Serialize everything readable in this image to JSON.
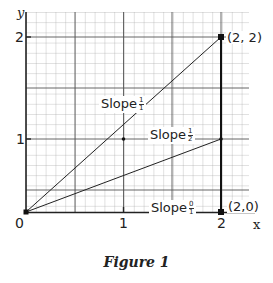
{
  "figure": {
    "caption": "Figure 1",
    "x_axis_label": "x",
    "y_axis_label": "y",
    "x_ticks": [
      "0",
      "1",
      "2"
    ],
    "y_ticks": [
      "1",
      "2"
    ],
    "points": [
      {
        "label": "(2, 2)"
      },
      {
        "label": "(2,0)"
      }
    ],
    "slopes": [
      {
        "text": "Slope",
        "num": "1",
        "den": "1"
      },
      {
        "text": "Slope",
        "num": "1",
        "den": "2"
      },
      {
        "text": "Slope",
        "num": "0",
        "den": "1"
      }
    ],
    "colors": {
      "grid_fine": "#9a9a9a",
      "grid_major": "#444444",
      "line": "#222222"
    }
  }
}
